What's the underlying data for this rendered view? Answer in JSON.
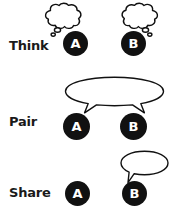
{
  "diagram": {
    "background_color": "#ffffff",
    "ink_color": "#111111",
    "bubble_fill_color": "#ffffff",
    "person_text_color": "#ffffff",
    "rows": [
      {
        "id": "think",
        "label": "Think",
        "persons": [
          {
            "id": "think-a",
            "label": "A",
            "bubble": "thought-cloud"
          },
          {
            "id": "think-b",
            "label": "B",
            "bubble": "thought-cloud"
          }
        ]
      },
      {
        "id": "pair",
        "label": "Pair",
        "persons": [
          {
            "id": "pair-a",
            "label": "A",
            "bubble": "shared-speech-bubble"
          },
          {
            "id": "pair-b",
            "label": "B",
            "bubble": "shared-speech-bubble"
          }
        ]
      },
      {
        "id": "share",
        "label": "Share",
        "persons": [
          {
            "id": "share-a",
            "label": "A",
            "bubble": "none"
          },
          {
            "id": "share-b",
            "label": "B",
            "bubble": "speech-bubble"
          }
        ]
      }
    ]
  }
}
